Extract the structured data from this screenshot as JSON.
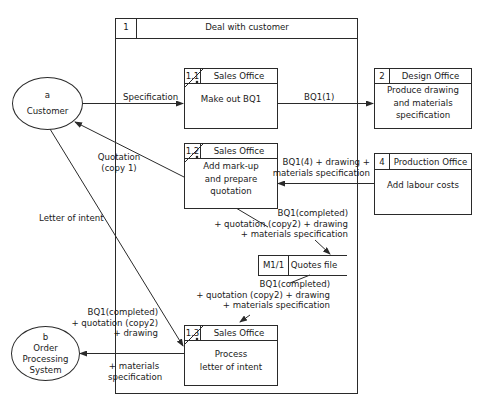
{
  "diagram": {
    "type": "data-flow-diagram",
    "main_process": {
      "number": "1",
      "title": "Deal with customer"
    },
    "processes": [
      {
        "id": "1.1",
        "number": "1.1",
        "location": "Sales Office",
        "lines": [
          "Make out BQ1"
        ]
      },
      {
        "id": "1.2",
        "number": "1.2",
        "location": "Sales Office",
        "lines": [
          "Add mark-up",
          "and prepare",
          "quotation"
        ]
      },
      {
        "id": "1.3",
        "number": "1.3",
        "location": "Sales Office",
        "lines": [
          "Process",
          "letter of intent"
        ]
      },
      {
        "id": "2",
        "number": "2",
        "location": "Design Office",
        "lines": [
          "Produce drawing",
          "and materials",
          "specification"
        ]
      },
      {
        "id": "4",
        "number": "4",
        "location": "Production Office",
        "lines": [
          "Add labour costs"
        ]
      }
    ],
    "entities": [
      {
        "id": "a",
        "letter": "a",
        "lines": [
          "Customer"
        ]
      },
      {
        "id": "b",
        "letter": "b",
        "lines": [
          "Order",
          "Processing",
          "System"
        ]
      }
    ],
    "data_store": {
      "id": "M1/1",
      "number": "M1/1",
      "name": "Quotes file"
    },
    "flows": {
      "specification": [
        "Specification"
      ],
      "bq1_1": [
        "BQ1(1)"
      ],
      "quotation": [
        "Quotation",
        "(copy 1)"
      ],
      "bq1_4": [
        "BQ1(4) + drawing +",
        "materials specification"
      ],
      "letter_of_intent": [
        "Letter of intent"
      ],
      "to_store": [
        "BQ1(completed)",
        "+ quotation (copy2) + drawing",
        "+ materials specification"
      ],
      "from_store": [
        "BQ1(completed)",
        "+ quotation (copy2) + drawing",
        "+ materials specification"
      ],
      "to_ops_top": [
        "BQ1(completed)",
        "+ quotation (copy2)",
        "+ drawing"
      ],
      "to_ops_bottom": [
        "+ materials",
        "specification"
      ]
    },
    "colors": {
      "line": "#2a2a2a",
      "background": "#ffffff"
    }
  }
}
